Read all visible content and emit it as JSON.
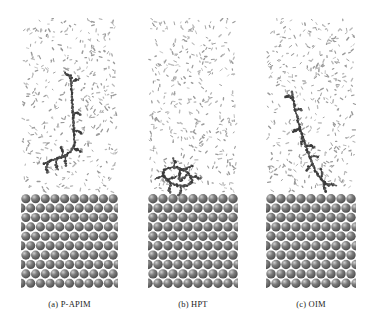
{
  "figure": {
    "type": "molecular-dynamics-snapshot-grid",
    "background_color": "#ffffff",
    "panel_count": 3,
    "width": 374,
    "height": 329
  },
  "palette": {
    "solvent_particle": "#9a9a9a",
    "solvent_particle_light": "#b8b8b8",
    "molecule_dark": "#3a3a3a",
    "molecule_mid": "#585858",
    "substrate_sphere": "#7d7d7d",
    "substrate_sphere_highlight": "#cfcfcf",
    "substrate_sphere_shadow": "#4f4f4f",
    "caption_text": "#1d1d1d"
  },
  "panels": [
    {
      "id": "panel-a",
      "caption": "(a) P-APIM",
      "label": "P-APIM",
      "index": "(a)",
      "box": {
        "left": 21,
        "top": 18,
        "width": 97,
        "height": 270
      },
      "solvent_region": {
        "top": 0,
        "height": 176,
        "particle_count": 430
      },
      "substrate_region": {
        "top": 176,
        "height": 94,
        "rows": 10,
        "cols": 10
      },
      "molecule": {
        "conformation": "extended-vertical-with-branched-foot",
        "bead_count": 150,
        "spine": [
          [
            50,
            58
          ],
          [
            50,
            64
          ],
          [
            50.5,
            70
          ],
          [
            51,
            76
          ],
          [
            51,
            82
          ],
          [
            51.5,
            88
          ],
          [
            52,
            94
          ],
          [
            52,
            100
          ],
          [
            52.5,
            106
          ],
          [
            53,
            112
          ],
          [
            53,
            118
          ],
          [
            53.5,
            124
          ],
          [
            52,
            130
          ],
          [
            49,
            134
          ],
          [
            45,
            137
          ],
          [
            41,
            139
          ],
          [
            36,
            141
          ],
          [
            31,
            142
          ],
          [
            27,
            144
          ],
          [
            23,
            146
          ]
        ],
        "branches": [
          [
            [
              51,
              60
            ],
            [
              47,
              57
            ],
            [
              44,
              55
            ]
          ],
          [
            [
              51.5,
              64
            ],
            [
              55,
              62
            ],
            [
              58,
              61
            ]
          ],
          [
            [
              52,
              96
            ],
            [
              56,
              95
            ],
            [
              59,
              96
            ]
          ],
          [
            [
              52.5,
              112
            ],
            [
              57,
              113
            ],
            [
              61,
              115
            ]
          ],
          [
            [
              45,
              137
            ],
            [
              44,
              143
            ],
            [
              45,
              148
            ]
          ],
          [
            [
              36,
              141
            ],
            [
              35,
              147
            ],
            [
              37,
              151
            ]
          ],
          [
            [
              27,
              144
            ],
            [
              25,
              150
            ],
            [
              27,
              154
            ]
          ],
          [
            [
              52,
              130
            ],
            [
              57,
              132
            ],
            [
              61,
              134
            ]
          ],
          [
            [
              41,
              139
            ],
            [
              42,
              133
            ],
            [
              40,
              129
            ]
          ]
        ]
      }
    },
    {
      "id": "panel-b",
      "caption": "(b) HPT",
      "label": "HPT",
      "index": "(b)",
      "box": {
        "left": 148,
        "top": 18,
        "width": 90,
        "height": 270
      },
      "solvent_region": {
        "top": 0,
        "height": 176,
        "particle_count": 400
      },
      "substrate_region": {
        "top": 176,
        "height": 94,
        "rows": 10,
        "cols": 9
      },
      "molecule": {
        "conformation": "compact-flat-adsorbed-cluster",
        "bead_count": 110,
        "spine": [
          [
            16,
            152
          ],
          [
            21,
            150
          ],
          [
            26,
            149
          ],
          [
            31,
            150
          ],
          [
            36,
            152
          ],
          [
            40,
            155
          ],
          [
            43,
            159
          ],
          [
            44,
            163
          ],
          [
            42,
            166
          ],
          [
            38,
            168
          ],
          [
            33,
            168
          ],
          [
            28,
            167
          ],
          [
            23,
            165
          ],
          [
            19,
            162
          ],
          [
            16,
            158
          ],
          [
            15,
            154
          ]
        ],
        "branches": [
          [
            [
              26,
              149
            ],
            [
              27,
              144
            ],
            [
              25,
              140
            ]
          ],
          [
            [
              36,
              152
            ],
            [
              41,
              149
            ],
            [
              45,
              148
            ]
          ],
          [
            [
              43,
              159
            ],
            [
              48,
              159
            ],
            [
              52,
              161
            ]
          ],
          [
            [
              33,
              168
            ],
            [
              33,
              173
            ],
            [
              31,
              177
            ]
          ],
          [
            [
              23,
              165
            ],
            [
              21,
              170
            ],
            [
              22,
              175
            ]
          ],
          [
            [
              16,
              158
            ],
            [
              11,
              159
            ],
            [
              7,
              161
            ]
          ],
          [
            [
              31,
              150
            ],
            [
              32,
              156
            ],
            [
              31,
              161
            ]
          ],
          [
            [
              40,
              155
            ],
            [
              36,
              160
            ],
            [
              32,
              163
            ]
          ],
          [
            [
              19,
              162
            ],
            [
              24,
              160
            ],
            [
              29,
              158
            ]
          ]
        ]
      }
    },
    {
      "id": "panel-c",
      "caption": "(c) OIM",
      "label": "OIM",
      "index": "(c)",
      "box": {
        "left": 266,
        "top": 18,
        "width": 90,
        "height": 270
      },
      "solvent_region": {
        "top": 0,
        "height": 176,
        "particle_count": 405
      },
      "substrate_region": {
        "top": 176,
        "height": 94,
        "rows": 10,
        "cols": 9
      },
      "molecule": {
        "conformation": "tilted-diagonal-chain",
        "bead_count": 145,
        "spine": [
          [
            26,
            74
          ],
          [
            27,
            80
          ],
          [
            28,
            86
          ],
          [
            29,
            92
          ],
          [
            31,
            98
          ],
          [
            32,
            104
          ],
          [
            34,
            110
          ],
          [
            36,
            116
          ],
          [
            38,
            122
          ],
          [
            40,
            128
          ],
          [
            42,
            134
          ],
          [
            44,
            140
          ],
          [
            47,
            146
          ],
          [
            49,
            152
          ],
          [
            52,
            157
          ],
          [
            55,
            161
          ],
          [
            58,
            164
          ],
          [
            61,
            166
          ],
          [
            63,
            168
          ]
        ],
        "branches": [
          [
            [
              27,
              80
            ],
            [
              23,
              78
            ],
            [
              20,
              79
            ]
          ],
          [
            [
              29,
              92
            ],
            [
              33,
              91
            ],
            [
              36,
              92
            ]
          ],
          [
            [
              34,
              110
            ],
            [
              30,
              112
            ],
            [
              27,
              114
            ]
          ],
          [
            [
              40,
              128
            ],
            [
              45,
              128
            ],
            [
              49,
              130
            ]
          ],
          [
            [
              47,
              146
            ],
            [
              43,
              149
            ],
            [
              40,
              152
            ]
          ],
          [
            [
              55,
              161
            ],
            [
              56,
              156
            ],
            [
              55,
              151
            ]
          ],
          [
            [
              61,
              166
            ],
            [
              66,
              166
            ],
            [
              70,
              168
            ]
          ],
          [
            [
              58,
              164
            ],
            [
              58,
              170
            ],
            [
              60,
              174
            ]
          ],
          [
            [
              44,
              140
            ],
            [
              48,
              138
            ],
            [
              52,
              139
            ]
          ],
          [
            [
              36,
              116
            ],
            [
              37,
              122
            ],
            [
              35,
              126
            ]
          ]
        ]
      }
    }
  ]
}
